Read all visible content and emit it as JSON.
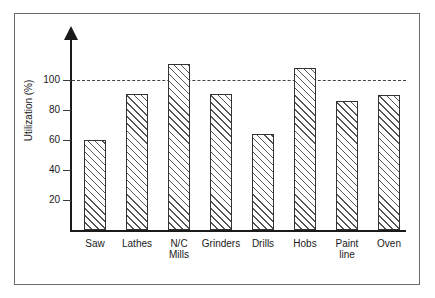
{
  "figure": {
    "frame_border_color": "#6b6b6b",
    "background_color": "#ffffff",
    "axis_color": "#1a1a1a",
    "bar_edge_color": "#333333",
    "hatch_color": "#555555",
    "reference_line_color": "#444444"
  },
  "chart_data": {
    "type": "bar",
    "title": "",
    "xlabel": "",
    "ylabel": "Utilization (%)",
    "categories": [
      "Saw",
      "Lathes",
      "N/C\nMills",
      "Grinders",
      "Drills",
      "Hobs",
      "Paint\nline",
      "Oven"
    ],
    "values": [
      60,
      91,
      111,
      91,
      64,
      108,
      86,
      90
    ],
    "ylim": [
      0,
      120
    ],
    "yticks": [
      20,
      40,
      60,
      80,
      100
    ],
    "ytick_labels": [
      "20",
      "40",
      "60",
      "80",
      "100"
    ],
    "grid": false,
    "legend": null,
    "annotations": [
      {
        "name": "target-utilization-line",
        "type": "hline",
        "value": 100,
        "style": "dashed",
        "label": ""
      }
    ],
    "bar_style": {
      "fill": "none",
      "hatch": "diagonal-lines",
      "edge": "solid"
    }
  }
}
